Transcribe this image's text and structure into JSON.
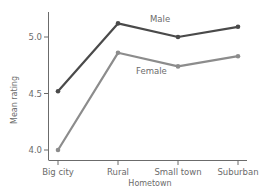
{
  "chart_data": {
    "type": "line",
    "title": "",
    "xlabel": "Hometown",
    "ylabel": "Mean rating",
    "categories": [
      "Big city",
      "Rural",
      "Small town",
      "Suburban"
    ],
    "series": [
      {
        "name": "Male",
        "values": [
          4.52,
          5.12,
          5.0,
          5.09
        ],
        "color": "#4a4a4a"
      },
      {
        "name": "Female",
        "values": [
          4.0,
          4.86,
          4.74,
          4.83
        ],
        "color": "#8c8c8c"
      }
    ],
    "yticks": [
      4.0,
      4.5,
      5.0
    ],
    "ytick_labels": [
      "4.0",
      "4.5",
      "5.0"
    ],
    "ylim": [
      3.9,
      5.23
    ],
    "grid": false,
    "legend": "inline labels near lines"
  },
  "labels": {
    "male": "Male",
    "female": "Female",
    "xlabel": "Hometown",
    "ylabel": "Mean rating"
  }
}
